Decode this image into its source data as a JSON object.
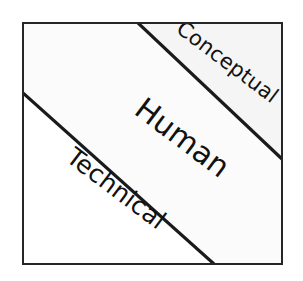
{
  "diagram": {
    "type": "three-band-diagonal-square",
    "title": "",
    "frame": {
      "border_color": "#262626",
      "background_color": "#fbfbfb",
      "x": 22,
      "y": 22,
      "width": 261,
      "height": 243
    },
    "divider_lines": [
      {
        "name": "upper-divider",
        "from": {
          "x": 137,
          "y": 22
        },
        "to": {
          "x": 283,
          "y": 159
        },
        "color": "#1a1a1a",
        "thickness": 3
      },
      {
        "name": "lower-divider",
        "from": {
          "x": 22,
          "y": 92
        },
        "to": {
          "x": 213,
          "y": 265
        },
        "color": "#1a1a1a",
        "thickness": 3
      }
    ],
    "bands": [
      {
        "id": "conceptual",
        "label": "Conceptual",
        "position": "upper-right",
        "fill": "#f7f7f7",
        "rotation_deg": 37
      },
      {
        "id": "human",
        "label": "Human",
        "position": "middle",
        "fill": "#fbfbfb",
        "rotation_deg": 37
      },
      {
        "id": "technical",
        "label": "Technical",
        "position": "lower-left",
        "fill": "#ffffff",
        "rotation_deg": 37
      }
    ]
  }
}
